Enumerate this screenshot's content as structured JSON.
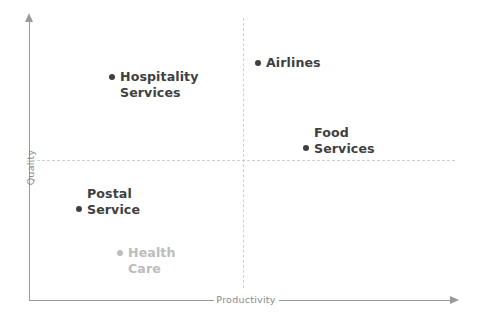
{
  "chart_data": {
    "type": "scatter",
    "title": "",
    "subtitle": "",
    "xlabel": "Productivity",
    "ylabel": "Quality",
    "grid": false,
    "legend": "none",
    "quadrant_divider_x": 0,
    "quadrant_divider_y": 0,
    "xlim": [
      -1,
      1
    ],
    "ylim": [
      -1,
      1
    ],
    "axis_arrows": true,
    "annotations": [
      "Dashed crosshair divides the plot into four quadrants",
      "Health Care is rendered in light grey (de-emphasised)"
    ],
    "points": [
      {
        "name": "Hospitality Services",
        "label_lines": [
          "Hospitality",
          "Services"
        ],
        "bullet_line": 0,
        "x": -0.38,
        "y": 0.66,
        "quadrant": "top-left",
        "color": "#3f3f3f",
        "muted": false
      },
      {
        "name": "Airlines",
        "label_lines": [
          "Airlines"
        ],
        "bullet_line": 0,
        "x": 0.07,
        "y": 0.77,
        "quadrant": "top-right",
        "color": "#3f3f3f",
        "muted": false
      },
      {
        "name": "Food Services",
        "label_lines": [
          "Food",
          "Services"
        ],
        "bullet_line": 1,
        "x": 0.3,
        "y": 0.05,
        "quadrant": "top-right",
        "color": "#3f3f3f",
        "muted": false
      },
      {
        "name": "Postal Service",
        "label_lines": [
          "Postal",
          "Service"
        ],
        "bullet_line": 1,
        "x": -0.77,
        "y": -0.25,
        "quadrant": "bottom-left",
        "color": "#3f3f3f",
        "muted": false
      },
      {
        "name": "Health Care",
        "label_lines": [
          "Health",
          "Care"
        ],
        "bullet_line": 0,
        "x": -0.58,
        "y": -0.57,
        "quadrant": "bottom-left",
        "color": "#bcbcbc",
        "muted": true
      }
    ]
  },
  "axes": {
    "x_title": "Productivity",
    "y_title": "Quality"
  },
  "points": {
    "hospitality": {
      "line1": "Hospitality",
      "line2": "Services"
    },
    "airlines": {
      "line1": "Airlines"
    },
    "food": {
      "line1": "Food",
      "line2": "Services"
    },
    "postal": {
      "line1": "Postal",
      "line2": "Service"
    },
    "healthcare": {
      "line1": "Health",
      "line2": "Care"
    }
  },
  "colors": {
    "axis": "#9a9a9a",
    "divider": "#cfcfcf",
    "label": "#3f3f3f",
    "label_muted": "#bcbcbc",
    "axis_title": "#8a8a8a",
    "background": "#ffffff"
  }
}
